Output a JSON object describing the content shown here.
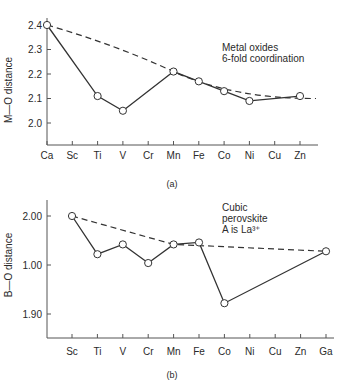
{
  "chart_data": [
    {
      "type": "line",
      "panel_label": "(a)",
      "title": "",
      "annotation": [
        "Metal oxides",
        "6-fold coordination"
      ],
      "xlabel": "",
      "ylabel": "M—O distance",
      "categories": [
        "Ca",
        "Sc",
        "Ti",
        "V",
        "Cr",
        "Mn",
        "Fe",
        "Co",
        "Ni",
        "Cu",
        "Zn"
      ],
      "y_ticks": [
        "2.0",
        "2.1",
        "2.2",
        "2.3",
        "2.4"
      ],
      "ylim": [
        1.9,
        2.45
      ],
      "grid": false,
      "series": [
        {
          "name": "observed",
          "style": "solid-with-open-circles",
          "points": [
            {
              "x": "Ca",
              "y": 2.4
            },
            {
              "x": "Ti",
              "y": 2.11
            },
            {
              "x": "V",
              "y": 2.05
            },
            {
              "x": "Mn",
              "y": 2.21
            },
            {
              "x": "Fe",
              "y": 2.17
            },
            {
              "x": "Co",
              "y": 2.13
            },
            {
              "x": "Ni",
              "y": 2.09
            },
            {
              "x": "Zn",
              "y": 2.11
            }
          ]
        },
        {
          "name": "spherical-ion trend",
          "style": "dashed",
          "points": [
            {
              "x": "Ca",
              "y": 2.4
            },
            {
              "x": "Mn",
              "y": 2.21
            },
            {
              "x": "Zn",
              "y": 2.11
            }
          ]
        }
      ]
    },
    {
      "type": "line",
      "panel_label": "(b)",
      "title": "",
      "annotation": [
        "Cubic",
        "perovskite",
        "A is La³⁺"
      ],
      "xlabel": "",
      "ylabel": "B—O distance",
      "categories": [
        "Sc",
        "Ti",
        "V",
        "Cr",
        "Mn",
        "Fe",
        "Co",
        "Ni",
        "Cu",
        "Zn",
        "Ga"
      ],
      "y_ticks": [
        "1.90",
        "1.00",
        "2.00"
      ],
      "ylim": [
        1.875,
        2.02
      ],
      "grid": false,
      "series": [
        {
          "name": "observed",
          "style": "solid-with-open-circles",
          "points": [
            {
              "x": "Sc",
              "y": 2.0
            },
            {
              "x": "Ti",
              "y": 1.961
            },
            {
              "x": "V",
              "y": 1.971
            },
            {
              "x": "Cr",
              "y": 1.952
            },
            {
              "x": "Mn",
              "y": 1.971
            },
            {
              "x": "Fe",
              "y": 1.973
            },
            {
              "x": "Co",
              "y": 1.911
            },
            {
              "x": "Ga",
              "y": 1.964
            }
          ]
        },
        {
          "name": "spherical-ion trend",
          "style": "dashed",
          "points": [
            {
              "x": "Sc",
              "y": 2.0
            },
            {
              "x": "Mn",
              "y": 1.971
            },
            {
              "x": "Ga",
              "y": 1.964
            }
          ]
        }
      ]
    }
  ]
}
